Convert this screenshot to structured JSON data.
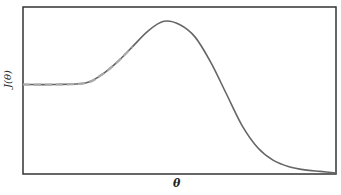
{
  "chart_data": {
    "type": "line",
    "title": "",
    "xlabel": "θ",
    "ylabel": "J(θ)",
    "grid": false,
    "legend": null,
    "ticks": {
      "x": [],
      "y": []
    },
    "xlim": [
      0,
      1
    ],
    "ylim": [
      0,
      1
    ],
    "series": [
      {
        "name": "J(θ) full curve",
        "style": "solid",
        "color": "#666666",
        "x": [
          0.0,
          0.1,
          0.2,
          0.25,
          0.3,
          0.35,
          0.4,
          0.45,
          0.5,
          0.55,
          0.6,
          0.65,
          0.7,
          0.75,
          0.8,
          0.85,
          0.9,
          0.95,
          1.0
        ],
        "y": [
          0.56,
          0.56,
          0.57,
          0.62,
          0.7,
          0.8,
          0.9,
          0.96,
          0.94,
          0.86,
          0.7,
          0.5,
          0.3,
          0.16,
          0.08,
          0.04,
          0.02,
          0.01,
          0.0
        ]
      },
      {
        "name": "J(θ) approximation",
        "style": "dashed",
        "color": "#aaaaaa",
        "x": [
          0.0,
          0.1,
          0.2,
          0.25,
          0.3,
          0.35
        ],
        "y": [
          0.56,
          0.56,
          0.57,
          0.62,
          0.7,
          0.8
        ]
      }
    ]
  },
  "labels": {
    "x_axis": "θ",
    "y_axis": "J(θ)"
  }
}
